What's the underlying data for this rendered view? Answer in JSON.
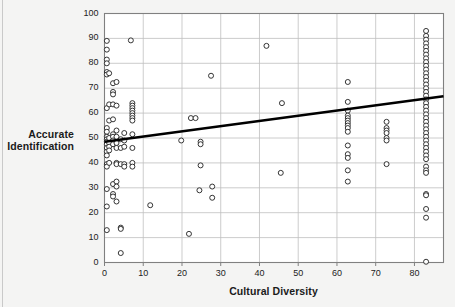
{
  "chart_data": {
    "type": "scatter",
    "title": "",
    "xlabel": "Cultural Diversity",
    "ylabel_line1": "Accurate",
    "ylabel_line2": "Identification",
    "xlim": [
      0,
      87.5
    ],
    "ylim": [
      0,
      100
    ],
    "xticks": [
      0,
      10,
      20,
      30,
      40,
      50,
      60,
      70,
      80
    ],
    "yticks": [
      0,
      10,
      20,
      30,
      40,
      50,
      60,
      70,
      80,
      90,
      100
    ],
    "grid": true,
    "legend": "none",
    "marker": "open-circle",
    "trendline": {
      "type": "linear",
      "x_start": 0,
      "y_start": 48.5,
      "x_end": 87.5,
      "y_end": 66.8,
      "color": "#000000",
      "width": 2.6
    },
    "series": [
      {
        "name": "observations",
        "points": [
          [
            0.6,
            89.0
          ],
          [
            0.6,
            85.5
          ],
          [
            0.6,
            81.5
          ],
          [
            0.6,
            80.0
          ],
          [
            0.6,
            76.5
          ],
          [
            0.6,
            75.5
          ],
          [
            0.6,
            62.0
          ],
          [
            0.6,
            54.0
          ],
          [
            0.6,
            52.5
          ],
          [
            0.6,
            50.5
          ],
          [
            0.6,
            49.5
          ],
          [
            0.6,
            48.5
          ],
          [
            0.6,
            47.5
          ],
          [
            0.6,
            46.0
          ],
          [
            0.6,
            44.5
          ],
          [
            0.6,
            43.0
          ],
          [
            0.6,
            39.5
          ],
          [
            0.6,
            38.5
          ],
          [
            0.6,
            29.5
          ],
          [
            0.6,
            22.5
          ],
          [
            0.6,
            13.0
          ],
          [
            1.2,
            76.0
          ],
          [
            1.2,
            63.5
          ],
          [
            1.2,
            57.0
          ],
          [
            1.2,
            50.0
          ],
          [
            1.2,
            48.0
          ],
          [
            1.2,
            46.5
          ],
          [
            1.2,
            45.0
          ],
          [
            1.2,
            40.0
          ],
          [
            2.2,
            72.0
          ],
          [
            2.2,
            68.5
          ],
          [
            2.2,
            67.5
          ],
          [
            2.2,
            63.5
          ],
          [
            2.2,
            57.5
          ],
          [
            2.2,
            51.5
          ],
          [
            2.2,
            50.5
          ],
          [
            2.2,
            49.0
          ],
          [
            2.2,
            47.5
          ],
          [
            2.2,
            31.5
          ],
          [
            2.2,
            27.5
          ],
          [
            2.2,
            26.5
          ],
          [
            3.1,
            72.5
          ],
          [
            3.1,
            63.0
          ],
          [
            3.1,
            53.0
          ],
          [
            3.1,
            50.5
          ],
          [
            3.1,
            48.0
          ],
          [
            3.1,
            46.0
          ],
          [
            3.1,
            40.0
          ],
          [
            3.1,
            39.5
          ],
          [
            3.1,
            32.5
          ],
          [
            3.1,
            30.5
          ],
          [
            3.1,
            24.5
          ],
          [
            4.2,
            49.5
          ],
          [
            4.2,
            46.0
          ],
          [
            4.2,
            39.5
          ],
          [
            4.2,
            14.0
          ],
          [
            4.2,
            13.5
          ],
          [
            4.2,
            3.8
          ],
          [
            5.1,
            52.0
          ],
          [
            5.1,
            49.0
          ],
          [
            5.1,
            46.5
          ],
          [
            5.1,
            39.5
          ],
          [
            5.1,
            38.5
          ],
          [
            6.8,
            89.2
          ],
          [
            7.2,
            64.0
          ],
          [
            7.2,
            63.0
          ],
          [
            7.2,
            62.0
          ],
          [
            7.2,
            61.0
          ],
          [
            7.2,
            60.0
          ],
          [
            7.2,
            59.0
          ],
          [
            7.2,
            58.0
          ],
          [
            7.2,
            57.0
          ],
          [
            7.2,
            51.5
          ],
          [
            7.2,
            46.0
          ],
          [
            7.2,
            40.0
          ],
          [
            7.2,
            38.5
          ],
          [
            11.8,
            23.0
          ],
          [
            19.8,
            49.0
          ],
          [
            21.8,
            11.5
          ],
          [
            22.3,
            58.0
          ],
          [
            23.5,
            58.0
          ],
          [
            24.8,
            48.5
          ],
          [
            24.8,
            47.5
          ],
          [
            24.8,
            39.0
          ],
          [
            24.5,
            29.0
          ],
          [
            27.5,
            75.0
          ],
          [
            27.8,
            30.5
          ],
          [
            27.8,
            26.0
          ],
          [
            41.8,
            87.0
          ],
          [
            45.8,
            64.0
          ],
          [
            45.5,
            36.0
          ],
          [
            62.8,
            72.5
          ],
          [
            62.8,
            64.5
          ],
          [
            62.8,
            61.0
          ],
          [
            62.8,
            59.0
          ],
          [
            62.8,
            58.0
          ],
          [
            62.8,
            57.0
          ],
          [
            62.8,
            56.0
          ],
          [
            62.8,
            55.0
          ],
          [
            62.8,
            54.0
          ],
          [
            62.8,
            52.5
          ],
          [
            62.8,
            47.0
          ],
          [
            62.8,
            43.5
          ],
          [
            62.8,
            42.0
          ],
          [
            62.8,
            37.0
          ],
          [
            62.8,
            32.5
          ],
          [
            72.8,
            56.5
          ],
          [
            72.8,
            54.0
          ],
          [
            72.8,
            53.0
          ],
          [
            72.8,
            52.0
          ],
          [
            72.8,
            50.0
          ],
          [
            72.8,
            49.0
          ],
          [
            72.8,
            39.5
          ],
          [
            83.0,
            93.0
          ],
          [
            83.0,
            91.0
          ],
          [
            83.0,
            89.5
          ],
          [
            83.0,
            88.0
          ],
          [
            83.0,
            86.5
          ],
          [
            83.0,
            85.0
          ],
          [
            83.0,
            83.5
          ],
          [
            83.0,
            82.0
          ],
          [
            83.0,
            80.5
          ],
          [
            83.0,
            79.0
          ],
          [
            83.0,
            77.5
          ],
          [
            83.0,
            76.0
          ],
          [
            83.0,
            74.5
          ],
          [
            83.0,
            73.0
          ],
          [
            83.0,
            71.5
          ],
          [
            83.0,
            70.0
          ],
          [
            83.0,
            68.5
          ],
          [
            83.0,
            67.0
          ],
          [
            83.0,
            65.5
          ],
          [
            83.0,
            64.0
          ],
          [
            83.0,
            62.5
          ],
          [
            83.0,
            61.0
          ],
          [
            83.0,
            59.5
          ],
          [
            83.0,
            58.0
          ],
          [
            83.0,
            56.5
          ],
          [
            83.0,
            55.0
          ],
          [
            83.0,
            53.5
          ],
          [
            83.0,
            52.0
          ],
          [
            83.0,
            50.5
          ],
          [
            83.0,
            49.0
          ],
          [
            83.0,
            47.5
          ],
          [
            83.0,
            46.0
          ],
          [
            83.0,
            44.5
          ],
          [
            83.0,
            43.0
          ],
          [
            83.0,
            41.5
          ],
          [
            83.0,
            38.5
          ],
          [
            83.0,
            37.0
          ],
          [
            83.0,
            36.0
          ],
          [
            83.0,
            27.5
          ],
          [
            83.0,
            27.0
          ],
          [
            83.0,
            21.5
          ],
          [
            83.0,
            18.0
          ],
          [
            83.0,
            0.3
          ]
        ]
      }
    ]
  },
  "axes": {
    "x_tick_labels": [
      "0",
      "10",
      "20",
      "30",
      "40",
      "50",
      "60",
      "70",
      "80"
    ],
    "y_tick_labels": [
      "0",
      "10",
      "20",
      "30",
      "40",
      "50",
      "60",
      "70",
      "80",
      "90",
      "100"
    ]
  },
  "colors": {
    "background": "#f4f4f3",
    "plot_background": "#ffffff",
    "grid": "#bfbfbf",
    "frame": "#808080",
    "marker_stroke": "#2a2a2a",
    "trendline": "#000000",
    "text": "#1b1b1b"
  }
}
